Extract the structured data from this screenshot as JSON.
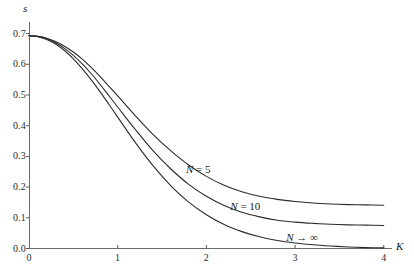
{
  "chart_data": {
    "type": "line",
    "title": "",
    "subtitle": "",
    "xlabel": "K",
    "ylabel": "s",
    "xlim": [
      0,
      4.15
    ],
    "ylim": [
      0.0,
      0.73
    ],
    "grid": false,
    "legend_position": "inline-curve-labels",
    "xticks": [
      "0",
      "1",
      "2",
      "3",
      "4"
    ],
    "xtick_values": [
      0,
      1,
      2,
      3,
      4
    ],
    "yticks": [
      "0.0",
      "0.1",
      "0.2",
      "0.3",
      "0.4",
      "0.5",
      "0.6",
      "0.7"
    ],
    "ytick_values": [
      0.0,
      0.1,
      0.2,
      0.3,
      0.4,
      0.5,
      0.6,
      0.7
    ],
    "x": [
      0.0,
      0.1,
      0.2,
      0.3,
      0.4,
      0.5,
      0.6,
      0.7,
      0.8,
      0.9,
      1.0,
      1.2,
      1.4,
      1.6,
      1.8,
      2.0,
      2.2,
      2.4,
      2.6,
      2.8,
      3.0,
      3.2,
      3.4,
      3.6,
      3.8,
      4.0
    ],
    "series": [
      {
        "name": "N = 5",
        "label": "N = 5",
        "color": "#2b2b2b",
        "values": [
          0.693,
          0.691,
          0.685,
          0.674,
          0.659,
          0.64,
          0.617,
          0.59,
          0.561,
          0.529,
          0.497,
          0.432,
          0.371,
          0.318,
          0.272,
          0.235,
          0.206,
          0.185,
          0.17,
          0.16,
          0.153,
          0.148,
          0.145,
          0.143,
          0.142,
          0.141
        ]
      },
      {
        "name": "N = 10",
        "label": "N = 10",
        "color": "#2b2b2b",
        "values": [
          0.693,
          0.691,
          0.683,
          0.67,
          0.652,
          0.629,
          0.601,
          0.57,
          0.535,
          0.498,
          0.461,
          0.387,
          0.318,
          0.259,
          0.209,
          0.17,
          0.14,
          0.118,
          0.103,
          0.092,
          0.086,
          0.082,
          0.079,
          0.077,
          0.076,
          0.075
        ]
      },
      {
        "name": "N -> infinity",
        "label": "N → ∞",
        "color": "#2b2b2b",
        "values": [
          0.693,
          0.69,
          0.681,
          0.666,
          0.645,
          0.618,
          0.586,
          0.55,
          0.511,
          0.47,
          0.428,
          0.345,
          0.269,
          0.204,
          0.151,
          0.11,
          0.078,
          0.055,
          0.038,
          0.026,
          0.018,
          0.012,
          0.008,
          0.005,
          0.003,
          0.002
        ]
      }
    ],
    "annotations": [
      {
        "text": "N = 5",
        "x": 1.77,
        "y": 0.255
      },
      {
        "text": "N = 10",
        "x": 2.27,
        "y": 0.135
      },
      {
        "text": "N → ∞",
        "x": 2.9,
        "y": 0.035
      }
    ],
    "axis_labels": {
      "x": "K",
      "y": "s"
    },
    "style": {
      "axis_color": "#5a5a5a",
      "curve_color": "#2b2b2b",
      "background": "#ffffff"
    }
  }
}
